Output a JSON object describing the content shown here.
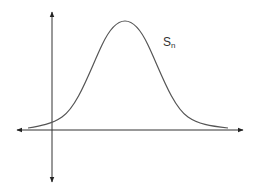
{
  "diagram": {
    "title": "",
    "curve_label": {
      "main": "S",
      "subscript": "n"
    },
    "colors": {
      "background": "#ffffff",
      "axes": "#333333",
      "curve": "#555555",
      "label": "#333333"
    },
    "axes": {
      "vertical": {
        "x": 52,
        "y_top": 12,
        "y_bottom": 182,
        "arrows": [
          "up",
          "down"
        ]
      },
      "horizontal": {
        "y": 130,
        "x_left": 17,
        "x_right": 243,
        "arrows": [
          "left",
          "right"
        ]
      }
    },
    "curve": {
      "type": "bell",
      "peak": {
        "x": 125,
        "y": 21
      },
      "start": {
        "x": 28,
        "y": 128
      },
      "end": {
        "x": 228,
        "y": 128
      }
    }
  }
}
